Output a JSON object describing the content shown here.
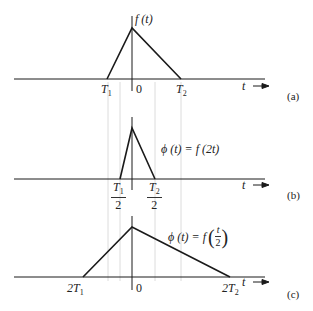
{
  "colors": {
    "line": "#1a1a1a",
    "guide": "#dcdcdc",
    "text": "#222222"
  },
  "panels": [
    {
      "id": "a",
      "caption": "(a)",
      "function_label": "f (t)",
      "axis_label": "t",
      "origin_label": "0",
      "left_label": {
        "main": "T",
        "sub": "1"
      },
      "right_label": {
        "main": "T",
        "sub": "2"
      }
    },
    {
      "id": "b",
      "caption": "(b)",
      "function_label": "ϕ (t)  =  f (2t)",
      "axis_label": "t",
      "left_label": {
        "main": "T",
        "sub": "1",
        "den": "2"
      },
      "right_label": {
        "main": "T",
        "sub": "2",
        "den": "2"
      }
    },
    {
      "id": "c",
      "caption": "(c)",
      "function_label_prefix": "ϕ (t)  =  f",
      "function_label_num": "t",
      "function_label_den": "2",
      "axis_label": "t",
      "origin_label": "0",
      "left_label": {
        "main": "2T",
        "sub": "1"
      },
      "right_label": {
        "main": "2T",
        "sub": "2"
      }
    }
  ]
}
